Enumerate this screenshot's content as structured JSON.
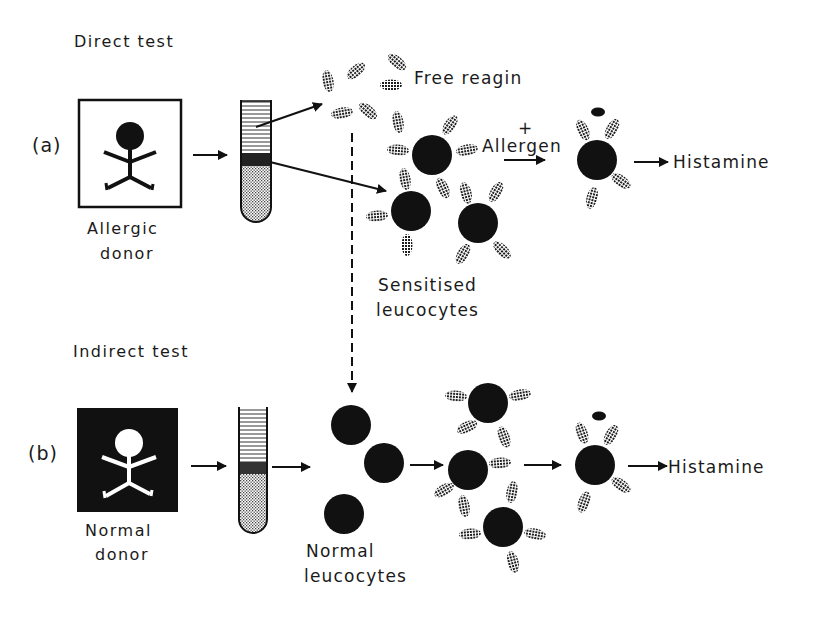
{
  "colors": {
    "ink": "#111111",
    "background": "#ffffff",
    "hatch": "#222222"
  },
  "direct_test": {
    "heading": "Direct test",
    "panel_label": "(a)",
    "donor_label_line1": "Allergic",
    "donor_label_line2": "donor",
    "free_reagin_label": "Free reagin",
    "sensitised_label_line1": "Sensitised",
    "sensitised_label_line2": "leucocytes",
    "plus_sign": "+",
    "allergen_label": "Allergen",
    "histamine_label": "Histamine"
  },
  "indirect_test": {
    "heading": "Indirect test",
    "panel_label": "(b)",
    "donor_label_line1": "Normal",
    "donor_label_line2": "donor",
    "normal_label_line1": "Normal",
    "normal_label_line2": "leucocytes",
    "histamine_label": "Histamine"
  },
  "icons": {
    "allergic_donor": "stick-figure-black-on-white",
    "normal_donor": "stick-figure-white-on-black",
    "test_tube": "test-tube-layered",
    "leucocyte": "filled-circle",
    "reagin": "hatched-ellipse",
    "histamine_granule": "small-black-ellipse"
  }
}
